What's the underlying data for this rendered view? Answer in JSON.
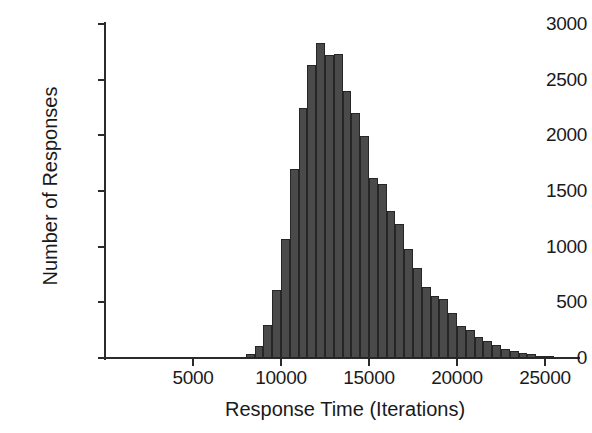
{
  "chart_data": {
    "type": "bar",
    "title": "",
    "subtitle": "",
    "xlabel": "Response Time (Iterations)",
    "ylabel": "Number of Responses",
    "xlim": [
      0,
      25800
    ],
    "ylim": [
      0,
      3000
    ],
    "grid": false,
    "legend": null,
    "bin_width": 500,
    "bar_color": "#4a4a4a",
    "bar_edge_color": "#262626",
    "axis_color": "#2b2b2b",
    "xticks": [
      5000,
      10000,
      15000,
      20000,
      25000
    ],
    "xtick_labels": [
      "5000",
      "10000",
      "15000",
      "20000",
      "25000"
    ],
    "yticks": [
      0,
      500,
      1000,
      1500,
      2000,
      2500,
      3000
    ],
    "ytick_labels": [
      "0",
      "500",
      "1000",
      "1500",
      "2000",
      "2500",
      "3000"
    ],
    "x": [
      8000,
      8500,
      9000,
      9500,
      10000,
      10500,
      11000,
      11500,
      12000,
      12500,
      13000,
      13500,
      14000,
      14500,
      15000,
      15500,
      16000,
      16500,
      17000,
      17500,
      18000,
      18500,
      19000,
      19500,
      20000,
      20500,
      21000,
      21500,
      22000,
      22500,
      23000,
      23500,
      24000,
      24500,
      25000
    ],
    "categories": [
      "8000",
      "8500",
      "9000",
      "9500",
      "10000",
      "10500",
      "11000",
      "11500",
      "12000",
      "12500",
      "13000",
      "13500",
      "14000",
      "14500",
      "15000",
      "15500",
      "16000",
      "16500",
      "17000",
      "17500",
      "18000",
      "18500",
      "19000",
      "19500",
      "20000",
      "20500",
      "21000",
      "21500",
      "22000",
      "22500",
      "23000",
      "23500",
      "24000",
      "24500",
      "25000"
    ],
    "values": [
      40,
      110,
      300,
      610,
      1070,
      1700,
      2250,
      2630,
      2830,
      2720,
      2730,
      2400,
      2200,
      1990,
      1620,
      1560,
      1320,
      1200,
      980,
      810,
      640,
      560,
      530,
      400,
      290,
      250,
      190,
      150,
      120,
      80,
      60,
      45,
      35,
      18,
      10
    ]
  },
  "axes": {
    "x_title": "Response Time (Iterations)",
    "y_title": "Number of Responses"
  }
}
